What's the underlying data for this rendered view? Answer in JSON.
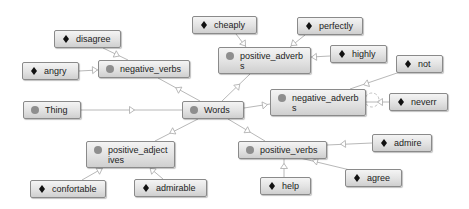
{
  "diagram": {
    "colors": {
      "edge": "#b8b8b8",
      "node_border": "#8a8a8a",
      "class_dot": "#8e8e8e",
      "individual_marker": "#111111",
      "background": "#ffffff"
    },
    "nodes": [
      {
        "id": "thing",
        "label": "Thing",
        "kind": "class",
        "icon": "class-circle-icon",
        "x": 23,
        "y": 101,
        "w": 58,
        "h": 18
      },
      {
        "id": "words",
        "label": "Words",
        "kind": "class",
        "icon": "class-circle-icon",
        "x": 182,
        "y": 101,
        "w": 62,
        "h": 18
      },
      {
        "id": "negative_verbs",
        "label": "negative_verbs",
        "kind": "class",
        "icon": "class-circle-icon",
        "x": 98,
        "y": 60,
        "w": 92,
        "h": 18
      },
      {
        "id": "positive_adverbs",
        "label": "positive_adverb\ns",
        "kind": "class",
        "icon": "class-circle-icon",
        "x": 218,
        "y": 47,
        "w": 93,
        "h": 27
      },
      {
        "id": "negative_adverbs",
        "label": "negative_adverb\ns",
        "kind": "class",
        "icon": "class-circle-icon",
        "x": 270,
        "y": 89,
        "w": 96,
        "h": 27
      },
      {
        "id": "positive_adjectives",
        "label": "positive_adject\nives",
        "kind": "class",
        "icon": "class-circle-icon",
        "x": 86,
        "y": 141,
        "w": 89,
        "h": 27
      },
      {
        "id": "positive_verbs",
        "label": "positive_verbs",
        "kind": "class",
        "icon": "class-circle-icon",
        "x": 238,
        "y": 141,
        "w": 89,
        "h": 18
      },
      {
        "id": "disagree",
        "label": "disagree",
        "kind": "individual",
        "icon": "individual-diamond-icon",
        "x": 54,
        "y": 30,
        "w": 67,
        "h": 18
      },
      {
        "id": "angry",
        "label": "angry",
        "kind": "individual",
        "icon": "individual-diamond-icon",
        "x": 22,
        "y": 62,
        "w": 57,
        "h": 18
      },
      {
        "id": "cheaply",
        "label": "cheaply",
        "kind": "individual",
        "icon": "individual-diamond-icon",
        "x": 192,
        "y": 16,
        "w": 65,
        "h": 18
      },
      {
        "id": "perfectly",
        "label": "perfectly",
        "kind": "individual",
        "icon": "individual-diamond-icon",
        "x": 297,
        "y": 17,
        "w": 66,
        "h": 18
      },
      {
        "id": "highly",
        "label": "highly",
        "kind": "individual",
        "icon": "individual-diamond-icon",
        "x": 330,
        "y": 45,
        "w": 57,
        "h": 18
      },
      {
        "id": "not",
        "label": "not",
        "kind": "individual",
        "icon": "individual-diamond-icon",
        "x": 396,
        "y": 55,
        "w": 47,
        "h": 18
      },
      {
        "id": "neverr",
        "label": "neverr",
        "kind": "individual",
        "icon": "individual-diamond-icon",
        "x": 389,
        "y": 93,
        "w": 59,
        "h": 18
      },
      {
        "id": "admire",
        "label": "admire",
        "kind": "individual",
        "icon": "individual-diamond-icon",
        "x": 372,
        "y": 134,
        "w": 60,
        "h": 18
      },
      {
        "id": "agree",
        "label": "agree",
        "kind": "individual",
        "icon": "individual-diamond-icon",
        "x": 345,
        "y": 169,
        "w": 57,
        "h": 18
      },
      {
        "id": "help",
        "label": "help",
        "kind": "individual",
        "icon": "individual-diamond-icon",
        "x": 260,
        "y": 177,
        "w": 51,
        "h": 18
      },
      {
        "id": "confortable",
        "label": "confortable",
        "kind": "individual",
        "icon": "individual-diamond-icon",
        "x": 30,
        "y": 180,
        "w": 76,
        "h": 18
      },
      {
        "id": "admirable",
        "label": "admirable",
        "kind": "individual",
        "icon": "individual-diamond-icon",
        "x": 134,
        "y": 179,
        "w": 73,
        "h": 18
      }
    ],
    "edges": [
      {
        "from": "thing",
        "to": "words",
        "x1": 81,
        "y1": 110,
        "x2": 182,
        "y2": 110,
        "ax": 132,
        "ay": 110
      },
      {
        "from": "words",
        "to": "negative_verbs",
        "x1": 200,
        "y1": 101,
        "x2": 158,
        "y2": 78,
        "ax": 178,
        "ay": 89
      },
      {
        "from": "words",
        "to": "positive_adverbs",
        "x1": 222,
        "y1": 101,
        "x2": 250,
        "y2": 74,
        "ax": 238,
        "ay": 86
      },
      {
        "from": "words",
        "to": "negative_adverbs",
        "x1": 244,
        "y1": 108,
        "x2": 270,
        "y2": 104,
        "ax": 265,
        "ay": 105
      },
      {
        "from": "words",
        "to": "positive_adjectives",
        "x1": 198,
        "y1": 119,
        "x2": 155,
        "y2": 141,
        "ax": 172,
        "ay": 132
      },
      {
        "from": "words",
        "to": "positive_verbs",
        "x1": 228,
        "y1": 119,
        "x2": 265,
        "y2": 141,
        "ax": 248,
        "ay": 131
      },
      {
        "from": "disagree",
        "to": "negative_verbs",
        "x1": 103,
        "y1": 48,
        "x2": 128,
        "y2": 60,
        "ax": 117,
        "ay": 55
      },
      {
        "from": "angry",
        "to": "negative_verbs",
        "x1": 79,
        "y1": 71,
        "x2": 98,
        "y2": 70,
        "ax": 95,
        "ay": 70
      },
      {
        "from": "cheaply",
        "to": "positive_adverbs",
        "x1": 236,
        "y1": 34,
        "x2": 246,
        "y2": 47,
        "ax": 244,
        "ay": 44
      },
      {
        "from": "perfectly",
        "to": "positive_adverbs",
        "x1": 305,
        "y1": 35,
        "x2": 290,
        "y2": 47,
        "ax": 293,
        "ay": 44
      },
      {
        "from": "highly",
        "to": "positive_adverbs",
        "x1": 330,
        "y1": 56,
        "x2": 311,
        "y2": 57,
        "ax": 314,
        "ay": 57
      },
      {
        "from": "not",
        "to": "negative_adverbs",
        "x1": 400,
        "y1": 72,
        "x2": 350,
        "y2": 89,
        "ax": 366,
        "ay": 84
      },
      {
        "from": "neverr",
        "to": "negative_adverbs",
        "x1": 389,
        "y1": 102,
        "x2": 366,
        "y2": 102,
        "ax": 380,
        "ay": 102
      },
      {
        "from": "admire",
        "to": "positive_verbs",
        "x1": 372,
        "y1": 143,
        "x2": 327,
        "y2": 145,
        "ax": 343,
        "ay": 144
      },
      {
        "from": "agree",
        "to": "positive_verbs",
        "x1": 350,
        "y1": 170,
        "x2": 300,
        "y2": 158,
        "ax": 315,
        "ay": 161
      },
      {
        "from": "help",
        "to": "positive_verbs",
        "x1": 284,
        "y1": 177,
        "x2": 284,
        "y2": 158,
        "ax": 284,
        "ay": 166
      },
      {
        "from": "confortable",
        "to": "positive_adjectives",
        "x1": 82,
        "y1": 180,
        "x2": 103,
        "y2": 168,
        "ax": 100,
        "ay": 170
      },
      {
        "from": "admirable",
        "to": "positive_adjectives",
        "x1": 163,
        "y1": 179,
        "x2": 150,
        "y2": 168,
        "ax": 152,
        "ay": 170
      }
    ],
    "self_loop": {
      "node": "negative_adverbs",
      "cx": 372,
      "cy": 100,
      "r": 7
    }
  }
}
